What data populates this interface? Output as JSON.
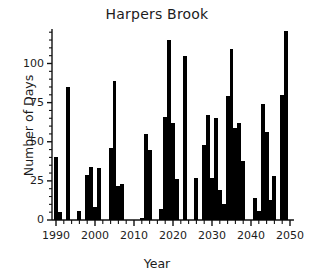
{
  "chart_data": {
    "type": "bar",
    "title": "Harpers Brook",
    "xlabel": "Year",
    "ylabel": "Number of Days",
    "xlim": [
      1989,
      2051
    ],
    "ylim": [
      0,
      122
    ],
    "grid": false,
    "legend": null,
    "y_ticks_major": [
      0,
      25,
      50,
      75,
      100
    ],
    "y_tick_labels": [
      "0",
      "25",
      "50",
      "75",
      "100"
    ],
    "y_ticks_minor": [
      5,
      10,
      15,
      20,
      30,
      35,
      40,
      45,
      55,
      60,
      65,
      70,
      80,
      85,
      90,
      95,
      105,
      110,
      115,
      120
    ],
    "x_ticks_major": [
      1990,
      2000,
      2010,
      2020,
      2030,
      2040,
      2050
    ],
    "x_tick_labels": [
      "1990",
      "2000",
      "2010",
      "2020",
      "2030",
      "2040",
      "2050"
    ],
    "bar_color": "#000000",
    "categories": [
      1990,
      1991,
      1992,
      1993,
      1994,
      1995,
      1996,
      1997,
      1998,
      1999,
      2000,
      2001,
      2002,
      2003,
      2004,
      2005,
      2006,
      2007,
      2008,
      2009,
      2010,
      2011,
      2012,
      2013,
      2014,
      2015,
      2016,
      2017,
      2018,
      2019,
      2020,
      2021,
      2022,
      2023,
      2024,
      2025,
      2026,
      2027,
      2028,
      2029,
      2030,
      2031,
      2032,
      2033,
      2034,
      2035,
      2036,
      2037,
      2038,
      2039,
      2040,
      2041,
      2042,
      2043,
      2044,
      2045,
      2046,
      2047,
      2048,
      2049,
      2050
    ],
    "values": [
      40,
      5,
      0,
      85,
      0,
      0,
      6,
      0,
      29,
      34,
      8,
      33,
      0,
      0,
      46,
      89,
      22,
      23,
      0,
      0,
      0,
      0,
      1,
      55,
      45,
      0,
      0,
      7,
      66,
      115,
      62,
      26,
      0,
      105,
      0,
      0,
      27,
      0,
      48,
      67,
      27,
      65,
      19,
      10,
      79,
      109,
      59,
      62,
      38,
      0,
      0,
      14,
      6,
      74,
      56,
      13,
      28,
      0,
      80,
      121,
      0
    ]
  }
}
